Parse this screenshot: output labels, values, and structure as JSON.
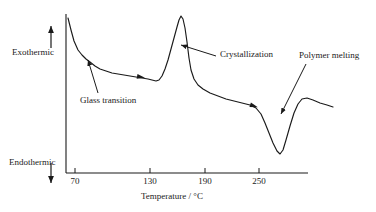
{
  "figure": {
    "type": "dsc-thermogram",
    "background_color": "#ffffff",
    "line_color": "#1a1a1a"
  },
  "axes": {
    "x_axis_title": "Temperature / °C",
    "x_ticks": [
      {
        "label": "70",
        "value": 70,
        "px": 75
      },
      {
        "label": "130",
        "value": 130,
        "px": 150
      },
      {
        "label": "190",
        "value": 190,
        "px": 205
      },
      {
        "label": "250",
        "value": 250,
        "px": 259
      }
    ],
    "y_axis_upper_label": "Exothermic",
    "y_axis_lower_label": "Endothermic",
    "y_axis_has_scale": false
  },
  "annotations": [
    {
      "id": "glass-transition",
      "label": "Glass transition",
      "text_x": 80,
      "text_y": 96,
      "arrow_from_x": 98,
      "arrow_from_y": 93,
      "arrow_to_x": 88,
      "arrow_to_y": 60
    },
    {
      "id": "crystallization",
      "label": "Crystallization",
      "text_x": 220,
      "text_y": 54,
      "arrow_from_x": 216,
      "arrow_from_y": 56,
      "arrow_to_x": 181,
      "arrow_to_y": 45
    },
    {
      "id": "polymer-melting",
      "label": "Polymer melting",
      "text_x": 300,
      "text_y": 51,
      "arrow_from_x": 306,
      "arrow_from_y": 64,
      "arrow_to_x": 281,
      "arrow_to_y": 114
    }
  ],
  "direction_markers": [
    {
      "id": "exothermic-arrow",
      "direction": "up",
      "x": 51,
      "y_tail": 48,
      "y_head": 26
    },
    {
      "id": "endothermic-arrow",
      "direction": "down",
      "x": 51,
      "y_tail": 163,
      "y_head": 183
    }
  ],
  "chart_data": {
    "type": "line",
    "title": "",
    "xlabel": "Temperature / °C",
    "ylabel": "Heat flow (Exothermic up / Endothermic down)",
    "xlim": [
      60,
      290
    ],
    "ylim_note": "arbitrary heat-flow units, no numeric y scale shown",
    "grid": false,
    "legend": null,
    "tick_labels_x": [
      "70",
      "130",
      "190",
      "250"
    ],
    "features": [
      {
        "name": "Glass transition",
        "approx_temperature_c": 80,
        "kind": "step-inflection"
      },
      {
        "name": "Crystallization",
        "approx_temperature_c": 163,
        "kind": "exothermic-peak"
      },
      {
        "name": "Polymer melting",
        "approx_temperature_c": 252,
        "kind": "endothermic-valley"
      }
    ],
    "series": [
      {
        "name": "Heat flow",
        "points_px": [
          [
            68,
            18
          ],
          [
            71,
            30
          ],
          [
            74,
            41
          ],
          [
            78,
            50
          ],
          [
            82,
            55
          ],
          [
            86,
            59
          ],
          [
            90,
            62
          ],
          [
            95,
            66
          ],
          [
            100,
            69
          ],
          [
            106,
            71
          ],
          [
            112,
            73
          ],
          [
            118,
            74
          ],
          [
            124,
            75
          ],
          [
            130,
            76
          ],
          [
            136,
            77
          ],
          [
            142,
            78
          ],
          [
            148,
            79
          ],
          [
            152,
            80
          ],
          [
            156,
            81
          ],
          [
            159,
            80
          ],
          [
            162,
            76
          ],
          [
            165,
            69
          ],
          [
            168,
            60
          ],
          [
            171,
            49
          ],
          [
            174,
            38
          ],
          [
            177,
            27
          ],
          [
            179,
            20
          ],
          [
            181,
            16
          ],
          [
            183,
            19
          ],
          [
            185,
            28
          ],
          [
            187,
            42
          ],
          [
            189,
            58
          ],
          [
            191,
            70
          ],
          [
            194,
            79
          ],
          [
            198,
            85
          ],
          [
            203,
            89
          ],
          [
            210,
            93
          ],
          [
            218,
            96
          ],
          [
            226,
            99
          ],
          [
            234,
            101
          ],
          [
            242,
            103
          ],
          [
            250,
            105
          ],
          [
            256,
            108
          ],
          [
            261,
            114
          ],
          [
            265,
            123
          ],
          [
            269,
            133
          ],
          [
            273,
            143
          ],
          [
            277,
            151
          ],
          [
            280,
            154
          ],
          [
            283,
            150
          ],
          [
            286,
            140
          ],
          [
            290,
            126
          ],
          [
            294,
            113
          ],
          [
            298,
            104
          ],
          [
            302,
            99
          ],
          [
            307,
            98
          ],
          [
            313,
            100
          ],
          [
            320,
            103
          ],
          [
            327,
            105
          ],
          [
            333,
            107
          ]
        ]
      }
    ],
    "curve_marker_arrowheads_px": [
      {
        "x": 141,
        "y": 77,
        "angle_deg": 10
      },
      {
        "x": 254,
        "y": 106,
        "angle_deg": 18
      }
    ]
  }
}
